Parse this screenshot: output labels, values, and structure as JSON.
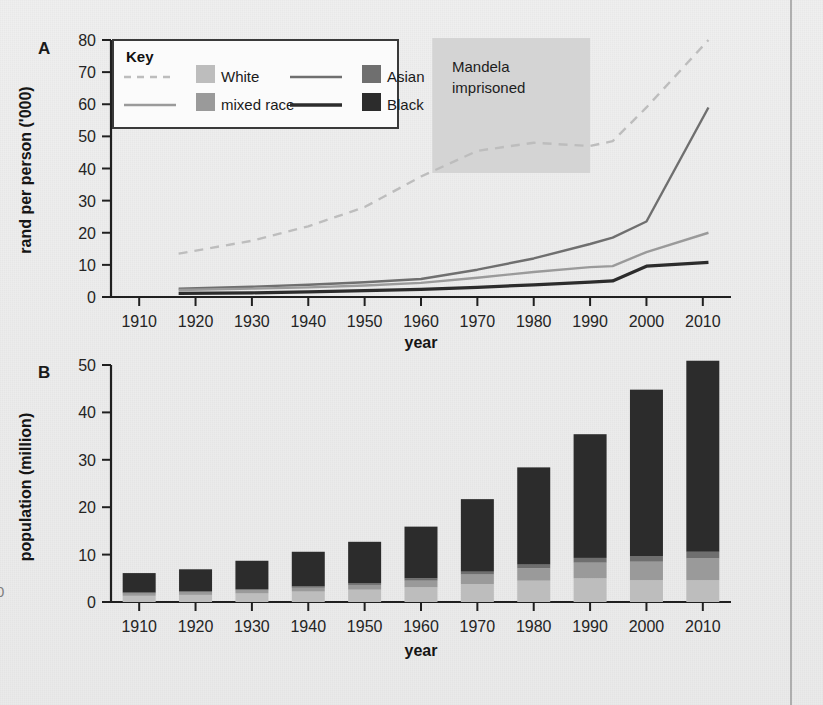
{
  "figure": {
    "panels": [
      "A",
      "B"
    ],
    "edge_fragment": "0"
  },
  "colors": {
    "white_series": "#bdbdbd",
    "mixed_race_series": "#9a9a9a",
    "asian_series": "#6f6f6f",
    "black_series": "#2c2c2c",
    "shade_band": "#d4d4d4",
    "axis": "#202020",
    "paper": "#ededed"
  },
  "legend": {
    "title": "Key",
    "entries": [
      {
        "label": "White",
        "swatch": "#bdbdbd",
        "line": "dashed",
        "thickness": 2
      },
      {
        "label": "mixed race",
        "swatch": "#9a9a9a",
        "line": "solid",
        "thickness": 2
      },
      {
        "label": "Asian",
        "swatch": "#6f6f6f",
        "line": "solid",
        "thickness": 2
      },
      {
        "label": "Black",
        "swatch": "#2c2c2c",
        "line": "solid",
        "thickness": 3
      }
    ]
  },
  "annotations": {
    "mandela": {
      "line1": "Mandela",
      "line2": "imprisoned",
      "start_year": 1962,
      "end_year": 1990
    }
  },
  "chart_data": [
    {
      "id": "panel-a",
      "panel": "A",
      "type": "line",
      "title": "",
      "xlabel": "year",
      "ylabel": "rand per person ('000)",
      "xlim": [
        1905,
        2015
      ],
      "ylim": [
        0,
        80
      ],
      "xticks": [
        1910,
        1920,
        1930,
        1940,
        1950,
        1960,
        1970,
        1980,
        1990,
        2000,
        2010
      ],
      "yticks": [
        0,
        10,
        20,
        30,
        40,
        50,
        60,
        70,
        80
      ],
      "grid": false,
      "legend_position": "top-left-inset",
      "x": [
        1917,
        1930,
        1940,
        1950,
        1960,
        1970,
        1980,
        1990,
        1994,
        2000,
        2011
      ],
      "series": [
        {
          "name": "White",
          "values": [
            13.5,
            17.5,
            22.0,
            28.0,
            37.5,
            45.5,
            48.0,
            47.0,
            48.5,
            59.0,
            80.0
          ]
        },
        {
          "name": "Asian",
          "values": [
            2.6,
            3.2,
            3.8,
            4.6,
            5.6,
            8.5,
            12.0,
            16.5,
            18.5,
            23.5,
            59.0
          ]
        },
        {
          "name": "mixed race",
          "values": [
            2.2,
            2.6,
            3.0,
            3.6,
            4.4,
            6.0,
            7.8,
            9.3,
            9.6,
            14.0,
            20.0
          ]
        },
        {
          "name": "Black",
          "values": [
            1.1,
            1.3,
            1.6,
            2.0,
            2.4,
            3.0,
            3.8,
            4.6,
            5.0,
            9.6,
            10.8
          ]
        }
      ],
      "shaded_region": {
        "label": "Mandela imprisoned",
        "x_start": 1962,
        "x_end": 1990
      }
    },
    {
      "id": "panel-b",
      "panel": "B",
      "type": "bar",
      "stacked": true,
      "title": "",
      "xlabel": "year",
      "ylabel": "population (million)",
      "ylim": [
        0,
        50
      ],
      "yticks": [
        0,
        10,
        20,
        30,
        40,
        50
      ],
      "grid": false,
      "categories": [
        1910,
        1920,
        1930,
        1940,
        1950,
        1960,
        1970,
        1980,
        1990,
        2000,
        2010
      ],
      "series": [
        {
          "name": "White",
          "values": [
            1.3,
            1.5,
            1.8,
            2.2,
            2.6,
            3.1,
            3.8,
            4.5,
            5.0,
            4.6,
            4.6
          ]
        },
        {
          "name": "mixed race",
          "values": [
            0.5,
            0.6,
            0.7,
            0.8,
            1.0,
            1.4,
            2.0,
            2.6,
            3.3,
            3.9,
            4.6
          ]
        },
        {
          "name": "Asian",
          "values": [
            0.2,
            0.2,
            0.2,
            0.3,
            0.4,
            0.5,
            0.6,
            0.8,
            1.0,
            1.2,
            1.4
          ]
        },
        {
          "name": "Black",
          "values": [
            4.1,
            4.6,
            6.0,
            7.3,
            8.7,
            10.9,
            15.3,
            20.5,
            26.1,
            35.1,
            40.3
          ]
        }
      ],
      "totals": [
        6.1,
        6.9,
        8.7,
        10.6,
        12.7,
        15.9,
        21.7,
        28.4,
        35.4,
        44.8,
        50.9
      ]
    }
  ]
}
